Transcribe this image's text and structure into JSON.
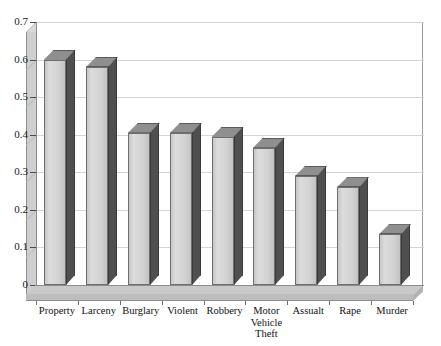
{
  "chart_data": {
    "type": "bar",
    "title": "",
    "xlabel": "",
    "ylabel": "",
    "ylim": [
      0,
      0.7
    ],
    "grid": true,
    "legend": "none",
    "style": "3d-column",
    "categories": [
      "Property",
      "Larceny",
      "Burglary",
      "Violent",
      "Robbery",
      "Motor Vehicle Theft",
      "Assualt",
      "Rape",
      "Murder"
    ],
    "values": [
      0.6,
      0.58,
      0.405,
      0.405,
      0.395,
      0.365,
      0.29,
      0.26,
      0.135
    ],
    "ytick_labels": [
      "0",
      "0.1",
      "0.2",
      "0.3",
      "0.4",
      "0.5",
      "0.6",
      "0.7"
    ],
    "ytick_values": [
      0,
      0.1,
      0.2,
      0.3,
      0.4,
      0.5,
      0.6,
      0.7
    ]
  },
  "axis": {
    "y_ticks": [
      {
        "label": "0.7",
        "value": 0.7
      },
      {
        "label": "0.6",
        "value": 0.6
      },
      {
        "label": "0.5",
        "value": 0.5
      },
      {
        "label": "0.4",
        "value": 0.4
      },
      {
        "label": "0.3",
        "value": 0.3
      },
      {
        "label": "0.2",
        "value": 0.2
      },
      {
        "label": "0.1",
        "value": 0.1
      },
      {
        "label": "0",
        "value": 0
      }
    ]
  },
  "categories": [
    {
      "label": "Property",
      "lines": [
        "Property"
      ],
      "value": 0.6
    },
    {
      "label": "Larceny",
      "lines": [
        "Larceny"
      ],
      "value": 0.58
    },
    {
      "label": "Burglary",
      "lines": [
        "Burglary"
      ],
      "value": 0.405
    },
    {
      "label": "Violent",
      "lines": [
        "Violent"
      ],
      "value": 0.405
    },
    {
      "label": "Robbery",
      "lines": [
        "Robbery"
      ],
      "value": 0.395
    },
    {
      "label": "Motor Vehicle Theft",
      "lines": [
        "Motor",
        "Vehicle",
        "Theft"
      ],
      "value": 0.365
    },
    {
      "label": "Assualt",
      "lines": [
        "Assualt"
      ],
      "value": 0.29
    },
    {
      "label": "Rape",
      "lines": [
        "Rape"
      ],
      "value": 0.26
    },
    {
      "label": "Murder",
      "lines": [
        "Murder"
      ],
      "value": 0.135
    }
  ],
  "colors": {
    "bar_front": "#d2d2d2",
    "bar_side": "#4a4a4a",
    "bar_top": "#8f8f8f",
    "wall": "#cfcfcf",
    "floor": "#c9c9c9",
    "gridline": "#d4d4d4",
    "axis": "#8c8c8c",
    "text": "#111111",
    "background": "#ffffff"
  }
}
